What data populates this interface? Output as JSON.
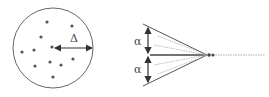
{
  "left_panel": {
    "delta_label": "Δ",
    "points": [
      [
        47,
        22
      ],
      [
        72,
        26
      ],
      [
        41,
        37
      ],
      [
        22,
        52
      ],
      [
        34,
        50
      ],
      [
        52,
        47
      ],
      [
        35,
        66
      ],
      [
        50,
        62
      ],
      [
        61,
        65
      ],
      [
        73,
        59
      ],
      [
        53,
        77
      ]
    ],
    "circle": {
      "cx": 53,
      "cy": 48,
      "r": 40
    }
  },
  "right_panel": {
    "alpha_top_label": "α",
    "alpha_bottom_label": "α"
  },
  "colors": {
    "stroke": "#555555",
    "dot": "#555555"
  }
}
